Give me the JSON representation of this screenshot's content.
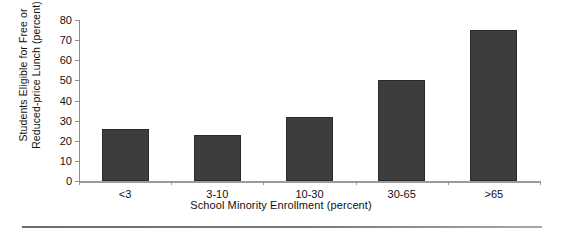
{
  "chart_data": {
    "type": "bar",
    "title": "",
    "xlabel": "School Minority Enrollment (percent)",
    "ylabel_lines": [
      "Students Eligible for Free or",
      "Reduced-price Lunch (percent)"
    ],
    "ylabel": "Students Eligible for Free or Reduced-price Lunch (percent)",
    "categories": [
      "<3",
      "3-10",
      "10-30",
      "30-65",
      ">65"
    ],
    "values": [
      26,
      23,
      32,
      50,
      75
    ],
    "ylim": [
      0,
      80
    ],
    "yticks": [
      0,
      10,
      20,
      30,
      40,
      50,
      60,
      70,
      80
    ],
    "ytick_labels": [
      "0",
      "10",
      "20",
      "30",
      "40",
      "50",
      "60",
      "70",
      "80"
    ],
    "grid": false,
    "legend": false,
    "legend_position": "none",
    "bar_color": "#3d3d3d",
    "axis_color": "#8d8d8d"
  },
  "axes": {
    "y_title_line1": "Students Eligible for Free or",
    "y_title_line2": "Reduced-price Lunch (percent)",
    "x_title": "School Minority Enrollment (percent)"
  }
}
